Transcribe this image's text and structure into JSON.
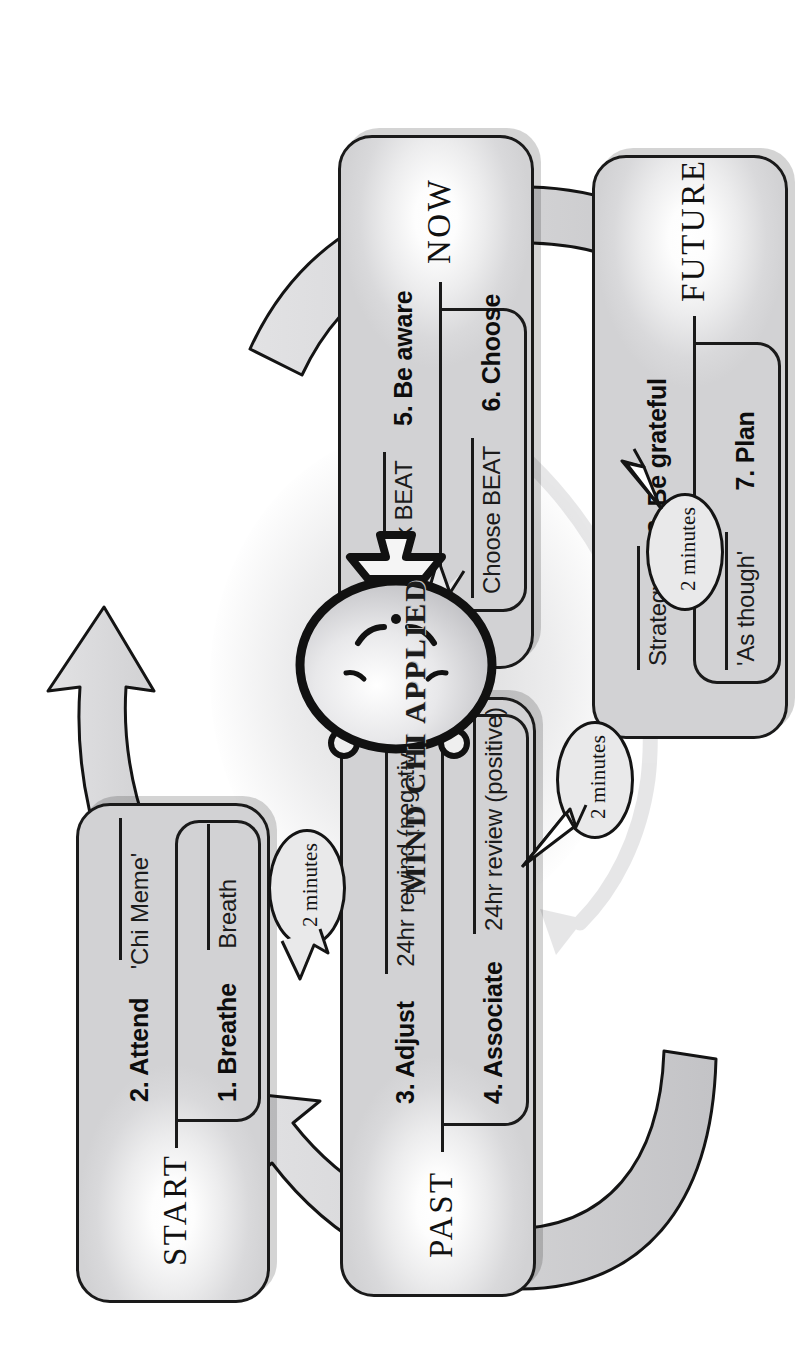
{
  "page": {
    "title": "Mind Chi Applied",
    "centre_label": "MIND CHI APPLIED"
  },
  "colors": {
    "box_fill": "#e6e6e7",
    "box_stroke": "#1a1a1a",
    "arrow_fill": "#d4d4d6",
    "arrow_stroke": "#141414",
    "bubble_fill": "#e9e9ea",
    "shadow": "rgba(0,0,0,0.17)",
    "text": "#111111"
  },
  "quadrants": [
    {
      "id": "start",
      "era": "START",
      "steps": [
        {
          "number_label": "1. Breathe",
          "note": "Breath"
        },
        {
          "number_label": "2. Attend",
          "note": "'Chi Meme'"
        }
      ]
    },
    {
      "id": "past",
      "era": "PAST",
      "steps": [
        {
          "number_label": "4. Associate",
          "note": "24hr review (positive)"
        },
        {
          "number_label": "3. Adjust",
          "note": "24hr rewind (negative)"
        }
      ]
    },
    {
      "id": "now",
      "era": "NOW",
      "steps": [
        {
          "number_label": "6. Choose",
          "note": "Choose BEAT"
        },
        {
          "number_label": "5. Be aware",
          "note": "Check BEAT"
        }
      ]
    },
    {
      "id": "future",
      "era": "FUTURE",
      "steps": [
        {
          "number_label": "7. Plan",
          "note": "'As though'"
        },
        {
          "number_label": "8. Be grateful",
          "note": "Strategy"
        }
      ]
    }
  ],
  "bubbles": [
    {
      "id": "bubble-start",
      "text": "2 minutes"
    },
    {
      "id": "bubble-past",
      "text": "2 minutes"
    },
    {
      "id": "bubble-now",
      "text": "2 minutes"
    },
    {
      "id": "bubble-future",
      "text": "2 minutes"
    }
  ],
  "arrows": [
    {
      "id": "arrow-start-to-past",
      "from": "START",
      "to": "PAST"
    },
    {
      "id": "arrow-past-to-now",
      "from": "PAST",
      "to": "NOW"
    },
    {
      "id": "arrow-now-to-future",
      "from": "NOW",
      "to": "FUTURE"
    },
    {
      "id": "arrow-future-to-start",
      "from": "FUTURE",
      "to": "START"
    }
  ],
  "icons": {
    "head": "head-icon",
    "bowtie": "bowtie-icon"
  }
}
